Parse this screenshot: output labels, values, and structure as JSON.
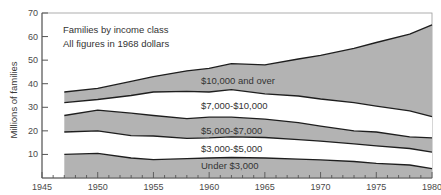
{
  "chart_data": {
    "type": "area",
    "stacked": true,
    "title": "Families by income class",
    "subtitle": "All figures in 1968 dollars",
    "xlabel": "",
    "ylabel": "Millions of families",
    "xlim": [
      1945,
      1980
    ],
    "ylim": [
      0,
      70
    ],
    "x_ticks": [
      1945,
      1950,
      1955,
      1960,
      1965,
      1970,
      1975,
      1980
    ],
    "y_ticks": [
      10,
      20,
      30,
      40,
      50,
      60,
      70
    ],
    "grid": false,
    "legend": "inline labels",
    "x": [
      1947,
      1950,
      1953,
      1955,
      1958,
      1960,
      1962,
      1965,
      1968,
      1970,
      1973,
      1975,
      1978,
      1980
    ],
    "boundaries": {
      "under_3000_top": [
        10.0,
        10.5,
        8.5,
        7.8,
        8.2,
        8.5,
        8.7,
        8.5,
        8.0,
        7.7,
        7.0,
        6.2,
        5.5,
        4.0
      ],
      "3000_5000_top": [
        19.5,
        20.0,
        18.0,
        17.8,
        16.8,
        17.0,
        17.5,
        17.2,
        16.3,
        15.6,
        14.5,
        13.6,
        12.5,
        11.0
      ],
      "5000_7000_top": [
        26.5,
        28.8,
        27.5,
        26.5,
        25.2,
        25.8,
        25.8,
        25.0,
        23.5,
        22.0,
        20.0,
        19.5,
        17.5,
        17.0
      ],
      "7000_10000_top": [
        32.0,
        33.3,
        35.0,
        36.5,
        36.8,
        36.5,
        37.5,
        35.7,
        34.8,
        33.5,
        32.0,
        30.5,
        28.5,
        26.0
      ],
      "10000_over_top": [
        36.5,
        38.0,
        41.0,
        43.0,
        45.5,
        46.5,
        48.5,
        48.0,
        50.5,
        52.0,
        55.0,
        57.5,
        61.0,
        65.0
      ]
    },
    "series": [
      {
        "name": "Under $3,000",
        "values": [
          10.0,
          10.5,
          8.5,
          7.8,
          8.2,
          8.5,
          8.7,
          8.5,
          8.0,
          7.7,
          7.0,
          6.2,
          5.5,
          4.0
        ]
      },
      {
        "name": "$3,000-$5,000",
        "values": [
          9.5,
          9.5,
          9.5,
          10.0,
          8.6,
          8.5,
          8.8,
          8.7,
          8.3,
          7.9,
          7.5,
          7.4,
          7.0,
          7.0
        ]
      },
      {
        "name": "$5,000-$7,000",
        "values": [
          7.0,
          8.8,
          9.5,
          8.7,
          8.4,
          8.8,
          8.3,
          7.8,
          7.2,
          6.4,
          5.5,
          5.9,
          5.0,
          6.0
        ]
      },
      {
        "name": "$7,000-$10,000",
        "values": [
          5.5,
          4.5,
          7.5,
          10.0,
          11.6,
          10.7,
          11.7,
          10.7,
          11.3,
          11.5,
          12.0,
          11.0,
          11.0,
          9.0
        ]
      },
      {
        "name": "$10,000 and over",
        "values": [
          4.5,
          4.7,
          6.0,
          6.5,
          8.7,
          10.0,
          11.0,
          12.3,
          15.7,
          18.5,
          23.0,
          27.0,
          32.5,
          39.0
        ]
      }
    ],
    "band_fill": [
      "#b3b3b3",
      "#ffffff",
      "#b3b3b3",
      "#ffffff",
      "#b3b3b3"
    ],
    "colors": {
      "fill": "#b3b3b3",
      "line": "#1e1e1e",
      "axis": "#555555"
    }
  },
  "labels": {
    "title": "Families by income class",
    "subtitle": "All figures in 1968 dollars",
    "ylabel": "Millions of families",
    "bands": {
      "b10000": "$10,000 and over",
      "b7000": "$7,000-$10,000",
      "b5000": "$5,000-$7,000",
      "b3000": "$3,000-$5,000",
      "under": "Under $3,000"
    },
    "x_ticks": [
      "1945",
      "1950",
      "1955",
      "1960",
      "1965",
      "1970",
      "1975",
      "1980"
    ],
    "y_ticks": [
      "10",
      "20",
      "30",
      "40",
      "50",
      "60",
      "70"
    ]
  }
}
